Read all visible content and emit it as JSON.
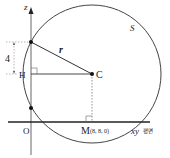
{
  "diagram": {
    "axis_labels": {
      "z": "z",
      "plane": "xy",
      "plane_suffix": "평면"
    },
    "points": {
      "origin": "O",
      "H": "H",
      "C": "C",
      "M": "M",
      "M_coords": "(8, 8, 0)"
    },
    "labels": {
      "sphere": "S",
      "radius": "r",
      "distance": "4"
    },
    "colors": {
      "line": "#333333",
      "dotted": "#888888",
      "point": "#111111"
    }
  }
}
